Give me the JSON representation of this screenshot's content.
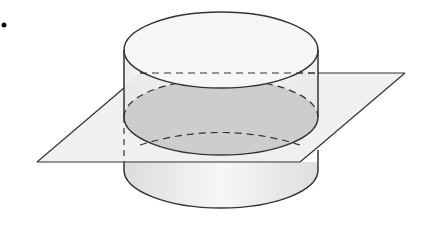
{
  "figure": {
    "description": "Cylinder intersected by a horizontal plane, showing an elliptical cross-section",
    "bullet": "•",
    "colors": {
      "outline": "#333333",
      "plane_fill": "#f0f0f0",
      "cylinder_top_fill": "#f6f6f6",
      "cylinder_side_fill": "#ebebeb",
      "cross_section_fill": "#c9c9c9",
      "bottom_fill": "#e6e6e6"
    },
    "shapes": {
      "cylinder": {
        "cx": 221,
        "rx": 97,
        "ry": 38,
        "top_y": 50,
        "section_y": 117,
        "bottom_y": 170
      },
      "plane": {
        "corners": [
          [
            140,
            73
          ],
          [
            405,
            73
          ],
          [
            300,
            162
          ],
          [
            37,
            162
          ]
        ]
      }
    }
  }
}
